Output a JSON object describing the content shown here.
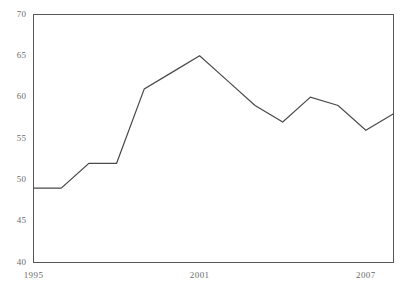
{
  "chart_data": {
    "type": "line",
    "title": "",
    "subtitle": "",
    "xlabel": "",
    "ylabel": "",
    "x": [
      1995,
      1996,
      1997,
      1998,
      1999,
      2000,
      2001,
      2002,
      2003,
      2004,
      2005,
      2006,
      2007,
      2008
    ],
    "values": [
      49,
      49,
      52,
      52,
      61,
      63,
      65,
      62,
      59,
      57,
      60,
      59,
      56,
      58
    ],
    "series": [
      {
        "name": "",
        "values": [
          49,
          49,
          52,
          52,
          61,
          63,
          65,
          62,
          59,
          57,
          60,
          59,
          56,
          58
        ]
      }
    ],
    "xlim": [
      1995,
      2008
    ],
    "ylim": [
      40,
      70
    ],
    "ytick_labels": [
      "70",
      "65",
      "60",
      "55",
      "50",
      "45",
      "40"
    ],
    "ytick_values": [
      70,
      65,
      60,
      55,
      50,
      45,
      40
    ],
    "xtick_labels": [
      "1995",
      "2001",
      "2007"
    ],
    "xtick_values": [
      1995,
      2001,
      2007
    ],
    "grid": false,
    "legend": false,
    "legend_position": "none",
    "line_color": "#4a4a4a",
    "axis_color": "#555555",
    "label_color": "#6b6b6b",
    "background_color": "#ffffff"
  },
  "axis": {
    "y_labels": [
      "70",
      "65",
      "60",
      "55",
      "50",
      "45",
      "40"
    ],
    "x_labels": [
      "1995",
      "2001",
      "2007"
    ]
  }
}
